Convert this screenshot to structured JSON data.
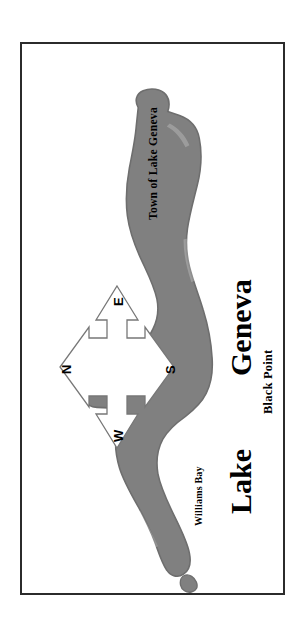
{
  "document": {
    "type": "map-figure",
    "orientation_note": "rotated-90-degrees",
    "background_color": "#ffffff",
    "frame_color": "#2b2b2b"
  },
  "map": {
    "water_fill_color": "#808080",
    "water_outline_color": "#6e6e6e",
    "labels": {
      "town": "Town of Lake Geneva",
      "lake_name_line1": "Lake",
      "lake_name_line2": "Geneva",
      "black_point": "Black Point",
      "williams_bay": "Williams Bay"
    }
  },
  "compass": {
    "name": "compass-rose",
    "north": "N",
    "east": "E",
    "south": "S",
    "west": "W"
  }
}
